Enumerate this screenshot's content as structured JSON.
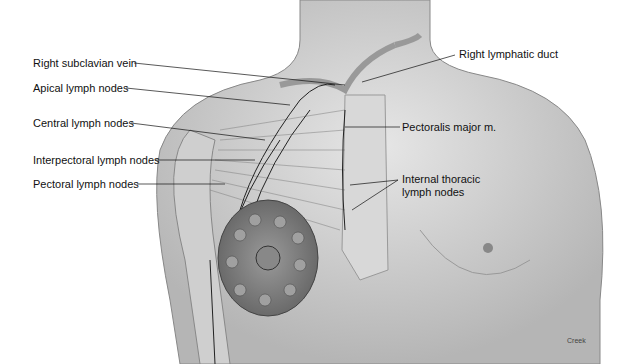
{
  "diagram": {
    "labels_left": [
      {
        "id": "right-subclavian-vein",
        "text": "Right subclavian vein"
      },
      {
        "id": "apical-lymph-nodes",
        "text": "Apical lymph nodes"
      },
      {
        "id": "central-lymph-nodes",
        "text": "Central lymph nodes"
      },
      {
        "id": "interpectoral-lymph-nodes",
        "text": "Interpectoral lymph nodes"
      },
      {
        "id": "pectoral-lymph-nodes",
        "text": "Pectoral lymph nodes"
      }
    ],
    "labels_right": [
      {
        "id": "right-lymphatic-duct",
        "text": "Right lymphatic duct"
      },
      {
        "id": "pectoralis-major",
        "text": "Pectoralis major m."
      },
      {
        "id": "internal-thoracic-line1",
        "text": "Internal thoracic"
      },
      {
        "id": "internal-thoracic-line2",
        "text": "lymph nodes"
      }
    ],
    "credit": "Creek"
  }
}
